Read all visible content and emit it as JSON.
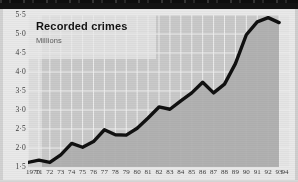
{
  "chart_data": {
    "type": "line",
    "title": "Recorded crimes",
    "subtitle": "Millions",
    "xlabel": "",
    "ylabel": "Millions",
    "ylim": [
      1.5,
      5.5
    ],
    "ytick_step": 0.5,
    "ytick_labels": [
      "5·5",
      "5·0",
      "4·5",
      "4·0",
      "3·5",
      "3·0",
      "2·5",
      "2·0",
      "1·5"
    ],
    "ytick_values": [
      5.5,
      5.0,
      4.5,
      4.0,
      3.5,
      3.0,
      2.5,
      2.0,
      1.5
    ],
    "xtick_labels": [
      "1970",
      "71",
      "72",
      "73",
      "74",
      "75",
      "76",
      "77",
      "78",
      "79",
      "80",
      "81",
      "82",
      "83",
      "84",
      "85",
      "86",
      "87",
      "88",
      "89",
      "90",
      "91",
      "92",
      "93",
      "94"
    ],
    "xlim": [
      1970,
      1994
    ],
    "grid": true,
    "legend": false,
    "series": [
      {
        "name": "Recorded crimes",
        "color": "#111111",
        "x": [
          1970,
          1971,
          1972,
          1973,
          1974,
          1975,
          1976,
          1977,
          1978,
          1979,
          1980,
          1981,
          1982,
          1983,
          1984,
          1985,
          1986,
          1987,
          1988,
          1989,
          1990,
          1991,
          1992,
          1993
        ],
        "values": [
          1.62,
          1.68,
          1.62,
          1.82,
          2.12,
          2.02,
          2.17,
          2.48,
          2.35,
          2.34,
          2.52,
          2.79,
          3.08,
          3.02,
          3.24,
          3.45,
          3.73,
          3.45,
          3.68,
          4.22,
          4.98,
          5.32,
          5.43,
          5.3
        ]
      }
    ],
    "annotations": []
  },
  "colors": {
    "plot_background": "#c9c9c9",
    "area_fill": "#b0b0b0",
    "grid_line": "#f2f2f2",
    "line": "#111111",
    "page_background": "#e9e9e9",
    "text": "#3a3a3a",
    "title_text": "#121212",
    "subtitle_text": "#5a5a5a"
  }
}
